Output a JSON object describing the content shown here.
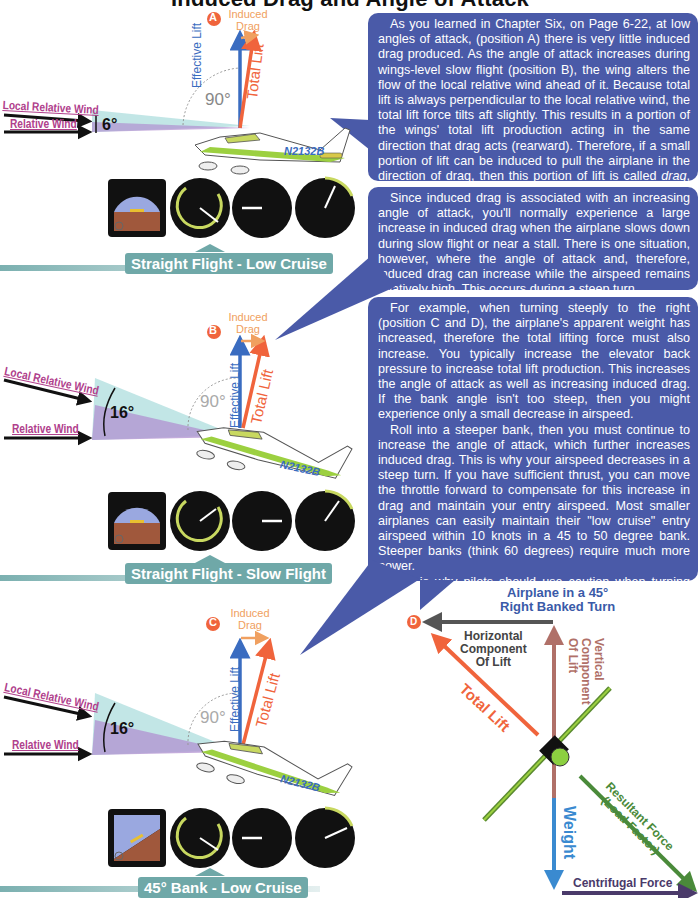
{
  "title": "Induced Drag and Angle of Attack",
  "panels": [
    {
      "id": "A",
      "position_label": "A",
      "induced_drag": "Induced Drag",
      "effective_lift": "Effective Lift",
      "total_lift": "Total Lift",
      "angle_90": "90°",
      "local_relative_wind": "Local Relative Wind",
      "relative_wind": "Relative Wind",
      "angle_of_attack": "6°",
      "tail_number": "N2132B",
      "banner": "Straight Flight - Low Cruise"
    },
    {
      "id": "B",
      "position_label": "B",
      "induced_drag": "Induced Drag",
      "effective_lift": "Effective Lift",
      "total_lift": "Total Lift",
      "angle_90": "90°",
      "local_relative_wind": "Local Relative Wind",
      "relative_wind": "Relative Wind",
      "angle_of_attack": "16°",
      "tail_number": "N2132B",
      "banner": "Straight Flight - Slow Flight"
    },
    {
      "id": "C",
      "position_label": "C",
      "induced_drag": "Induced Drag",
      "effective_lift": "Effective Lift",
      "total_lift": "Total Lift",
      "angle_90": "90°",
      "local_relative_wind": "Local Relative Wind",
      "relative_wind": "Relative Wind",
      "angle_of_attack": "16°",
      "tail_number": "N2132B",
      "banner": "45° Bank - Low Cruise"
    }
  ],
  "instruments": {
    "airspeed": {
      "label": "KNOTS",
      "ticks": [
        "40",
        "60",
        "80",
        "100",
        "120",
        "140"
      ]
    },
    "vsi": {
      "label": "VSI",
      "sublabel": "100 FEET PER MIN",
      "ticks": [
        "5",
        "10",
        "15",
        "20",
        "15",
        "10",
        "5",
        "0"
      ]
    },
    "tach": {
      "label": "RPM HUNDREDS",
      "ticks": [
        "0",
        "5",
        "10",
        "15",
        "20",
        "25",
        "30",
        "35"
      ]
    }
  },
  "text_blocks": [
    {
      "paragraphs": [
        "As you learned in Chapter Six, on Page 6-22, at low angles of attack, (position A) there is very little induced drag produced. As the angle of attack increases during wings-level slow flight (position B), the wing alters the flow of the local relative wind ahead of it. Because total lift is always perpendicular to the local relative wind, the total lift force tilts aft slightly. This results in a portion of the wings' total lift production acting in the same direction that drag acts (rearward). Therefore, if a small portion of lift can be induced to pull the airplane in the direction of drag, then this portion of lift is called drag, otherwise known as, induced drag."
      ]
    },
    {
      "paragraphs": [
        "Since induced drag is associated with an increasing angle of attack, you'll normally experience a large increase in induced drag when the airplane slows down during slow flight or near a stall. There is one situation, however, where the angle of attack and, therefore, induced drag can increase while the airspeed remains relatively high. This occurs during a steep turn."
      ]
    },
    {
      "paragraphs": [
        "For example, when turning steeply to the right (position C and D), the airplane's apparent weight has increased, therefore the total lifting force must also increase. You typically increase the elevator back pressure to increase total lift production. This increases the angle of attack as well as increasing induced drag. If the bank angle isn't too steep, then you might experience only a small decrease in airspeed.",
        "Roll into a steeper bank, then you must continue to increase the angle of attack, which further increases induced drag. This is why your airspeed decreases in a steep turn. If you have sufficient thrust, you can move the throttle forward to compensate for this increase in drag and maintain your entry airspeed. Most smaller airplanes can easily maintain their \"low cruise\" entry airspeed within 10 knots in a 45 to 50 degree bank. Steeper banks (think 60 degrees) require much more power.",
        "This is why pilots should use caution when turning steeply from base to final approach with power off. It's very easy to experience a quick decrease in airspeed. Combine this with the increasing stall speed associated with turning steeply and you have the makings of an accelerated stall close to the ground."
      ]
    }
  ],
  "bank_diagram": {
    "position_label": "D",
    "title_line1": "Airplane in a 45°",
    "title_line2": "Right Banked Turn",
    "horizontal_component": [
      "Horizontal",
      "Component",
      "Of Lift"
    ],
    "vertical_component": [
      "Vertical",
      "Component",
      "Of Lift"
    ],
    "total_lift": "Total Lift",
    "weight": "Weight",
    "resultant_force": "Resultant Force",
    "load_factor": "(Load Factor)",
    "centrifugal_force": "Centrifugal Force"
  },
  "colors": {
    "bubble": "#4a5aa8",
    "effective_lift": "#3a6cc0",
    "total_lift": "#f0643c",
    "induced_drag": "#f0a060",
    "wind_label": "#b0408c",
    "banner": "#6fa8a8",
    "resultant": "#4a8a3a",
    "vertical_component": "#b07068",
    "weight": "#3a8ad0"
  }
}
